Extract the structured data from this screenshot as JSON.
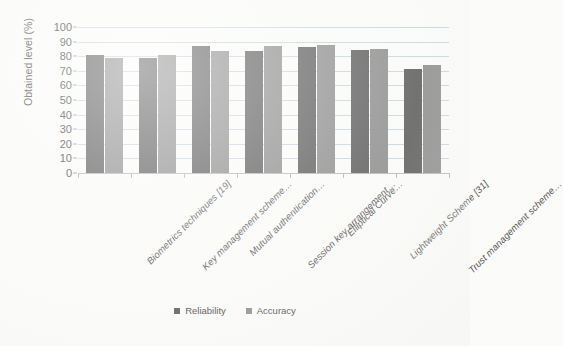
{
  "chart_data": {
    "type": "bar",
    "title": "",
    "xlabel": "",
    "ylabel": "Obtained level (%)",
    "ylim": [
      0,
      100
    ],
    "ytick_step": 10,
    "yticks": [
      100,
      90,
      80,
      70,
      60,
      50,
      40,
      30,
      20,
      10,
      0
    ],
    "grid": true,
    "legend_position": "bottom-center",
    "categories": [
      "Biometrics techniques [19]",
      "Key management scheme…",
      "Mutual authentication…",
      "Session key arrangement…",
      "Elliptical Curve…",
      "Lightweight Scheme [31]",
      "Trust management scheme…"
    ],
    "series": [
      {
        "name": "Reliability",
        "color": "#5b5b5b",
        "values": [
          81,
          79,
          87,
          83.5,
          86,
          84,
          71
        ]
      },
      {
        "name": "Accuracy",
        "color": "#8c8c8c",
        "values": [
          79,
          81,
          83.5,
          87,
          88,
          85,
          74
        ]
      }
    ]
  },
  "legend": {
    "items": [
      {
        "label": "Reliability",
        "marker": "square-marker-icon"
      },
      {
        "label": "Accuracy",
        "marker": "square-marker-icon"
      }
    ]
  },
  "colors": {
    "series_reliability": "#5b5b5b",
    "series_accuracy": "#8c8c8c",
    "gridline": "#c9d4de",
    "axis": "#b8b8b8",
    "background": "#fbfbfa",
    "text": "#4a4a4a"
  }
}
